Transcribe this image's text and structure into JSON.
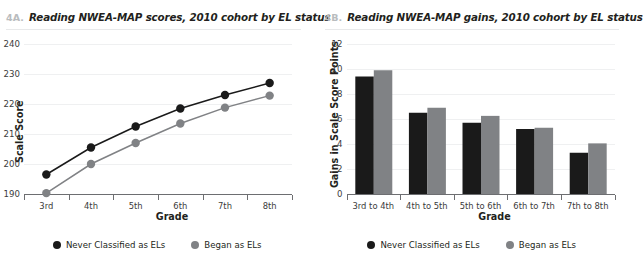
{
  "panels": [
    {
      "figure_number": "4A.",
      "title": "Reading NWEA-MAP scores, 2010 cohort by EL status"
    },
    {
      "figure_number": "4B.",
      "title": "Reading NWEA-MAP gains, 2010 cohort by EL status"
    }
  ],
  "legend": {
    "items": [
      {
        "label": "Never Classified as ELs",
        "color": "#1a1a1a"
      },
      {
        "label": "Began as ELs",
        "color": "#808285"
      }
    ]
  },
  "colors": {
    "dark_series": "#1a1a1a",
    "gray_series": "#808285",
    "axis": "#6d6e71",
    "gridline": "#eff0f1",
    "figure_number": "#b9bcbe",
    "text": "#231f20"
  },
  "chart_data": [
    {
      "type": "line",
      "title": "Reading NWEA-MAP scores, 2010 cohort by EL status",
      "xlabel": "Grade",
      "ylabel": "Scale Score",
      "categories": [
        "3rd",
        "4th",
        "5th",
        "6th",
        "7th",
        "8th"
      ],
      "ylim": [
        190,
        240
      ],
      "yticks": [
        190,
        200,
        210,
        220,
        230,
        240
      ],
      "grid": true,
      "legend_position": "bottom",
      "series": [
        {
          "name": "Never Classified as ELs",
          "color": "#1a1a1a",
          "values": [
            196.5,
            205.5,
            212.5,
            218.5,
            223.0,
            227.0
          ]
        },
        {
          "name": "Began as ELs",
          "color": "#808285",
          "values": [
            190.3,
            200.0,
            207.0,
            213.5,
            218.8,
            222.8
          ]
        }
      ]
    },
    {
      "type": "bar",
      "title": "Reading NWEA-MAP gains, 2010 cohort by EL status",
      "xlabel": "Grade",
      "ylabel": "Gains in Scale Score Points",
      "categories": [
        "3rd to 4th",
        "4th to 5th",
        "5th to 6th",
        "6th to 7th",
        "7th to 8th"
      ],
      "ylim": [
        0,
        12
      ],
      "yticks": [
        0,
        2,
        4,
        6,
        8,
        10,
        12
      ],
      "grid": true,
      "legend_position": "bottom",
      "series": [
        {
          "name": "Never Classified as ELs",
          "color": "#1a1a1a",
          "values": [
            9.4,
            6.5,
            5.7,
            5.2,
            3.3
          ]
        },
        {
          "name": "Began as ELs",
          "color": "#808285",
          "values": [
            9.9,
            6.9,
            6.25,
            5.3,
            4.05
          ]
        }
      ]
    }
  ]
}
